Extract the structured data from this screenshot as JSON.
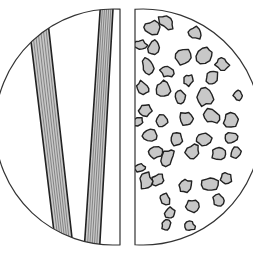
{
  "diagram": {
    "title": "",
    "canvas": {
      "width": 253,
      "height": 253,
      "background": "#ffffff"
    },
    "circle": {
      "cx": 127,
      "cy": 127,
      "r": 118,
      "stroke": "#333333"
    },
    "left_half": {
      "label": "",
      "clip_right_x": 120,
      "description": "fibrous striated bands",
      "fill": "#c8c8c8",
      "stroke": "#222222",
      "bands": [
        {
          "top": [
            [
              33,
              58
            ],
            [
              50,
              40
            ]
          ],
          "bottom": [
            [
              54,
              232
            ],
            [
              72,
              238
            ]
          ],
          "striations": 7
        },
        {
          "top": [
            [
              100,
              12
            ],
            [
              113,
              9
            ]
          ],
          "bottom": [
            [
              85,
              237
            ],
            [
              100,
              241
            ]
          ],
          "striations": 6
        }
      ]
    },
    "right_half": {
      "label": "",
      "clip_left_x": 135,
      "description": "granular particles",
      "fill": "#c8c8c8",
      "stroke": "#222222",
      "particles": [
        [
          152,
          28,
          7,
          9
        ],
        [
          166,
          22,
          6,
          9
        ],
        [
          195,
          33,
          7,
          6
        ],
        [
          140,
          45,
          5,
          7
        ],
        [
          154,
          47,
          8,
          6
        ],
        [
          183,
          57,
          9,
          8
        ],
        [
          205,
          55,
          7,
          9
        ],
        [
          222,
          64,
          7,
          6
        ],
        [
          148,
          66,
          8,
          6
        ],
        [
          167,
          71,
          6,
          7
        ],
        [
          212,
          78,
          8,
          7
        ],
        [
          188,
          80,
          6,
          5
        ],
        [
          143,
          88,
          6,
          8
        ],
        [
          163,
          89,
          8,
          7
        ],
        [
          180,
          97,
          6,
          5
        ],
        [
          205,
          97,
          9,
          8
        ],
        [
          238,
          95,
          5,
          5
        ],
        [
          145,
          110,
          7,
          6
        ],
        [
          162,
          121,
          7,
          6
        ],
        [
          187,
          119,
          8,
          7
        ],
        [
          211,
          116,
          9,
          7
        ],
        [
          232,
          120,
          8,
          7
        ],
        [
          138,
          122,
          4,
          6
        ],
        [
          150,
          135,
          8,
          6
        ],
        [
          176,
          140,
          7,
          6
        ],
        [
          203,
          139,
          8,
          7
        ],
        [
          231,
          138,
          6,
          7
        ],
        [
          155,
          153,
          8,
          6
        ],
        [
          168,
          157,
          6,
          9
        ],
        [
          193,
          152,
          8,
          7
        ],
        [
          219,
          153,
          8,
          7
        ],
        [
          236,
          153,
          5,
          6
        ],
        [
          140,
          168,
          4,
          6
        ],
        [
          158,
          180,
          7,
          6
        ],
        [
          185,
          186,
          8,
          6
        ],
        [
          210,
          184,
          8,
          7
        ],
        [
          226,
          178,
          6,
          6
        ],
        [
          146,
          181,
          6,
          9
        ],
        [
          165,
          199,
          7,
          5
        ],
        [
          192,
          206,
          7,
          7
        ],
        [
          219,
          200,
          6,
          6
        ],
        [
          170,
          213,
          5,
          6
        ],
        [
          166,
          225,
          5,
          5
        ],
        [
          190,
          226,
          5,
          5
        ]
      ]
    }
  }
}
